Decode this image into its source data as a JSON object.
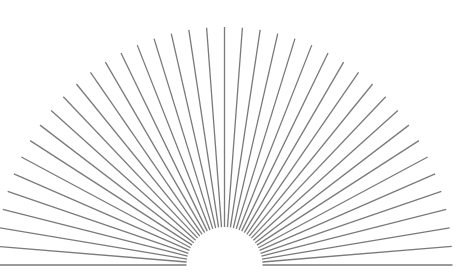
{
  "diagram": {
    "type": "radial-sunburst",
    "background": "#ffffff",
    "center": {
      "x": 224.5,
      "y": 265
    },
    "inner_radius": 38,
    "outer_radius_x": 228,
    "outer_radius_y": 238,
    "ray_count": 41,
    "angle_start_deg": 0,
    "angle_end_deg": 180,
    "angle_step_deg": 4.5,
    "stroke_color": "#7a7a7a",
    "stroke_width": 1.3
  }
}
